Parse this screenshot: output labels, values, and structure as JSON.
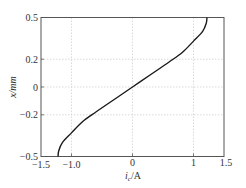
{
  "chart_data": {
    "type": "line",
    "title": "",
    "xlabel": "i_c/A",
    "xlabel_main": "i",
    "xlabel_sub": "c",
    "xlabel_unit": "/A",
    "ylabel": "x/mm",
    "xlim": [
      -1.5,
      1.5
    ],
    "ylim": [
      -0.5,
      0.5
    ],
    "xticks": [
      "-1.5",
      "-1.0",
      "0",
      "1",
      "1.5"
    ],
    "yticks": [
      "0.5",
      "0.2",
      "0",
      "-0.2",
      "-0.5"
    ],
    "grid": true,
    "legend": null,
    "series": [
      {
        "name": "i_c vs x",
        "color": "#1a1a1a",
        "points": [
          [
            -1.22,
            -0.5
          ],
          [
            -1.21,
            -0.46
          ],
          [
            -1.15,
            -0.4
          ],
          [
            -1.0,
            -0.33
          ],
          [
            -0.82,
            -0.25
          ],
          [
            -0.6,
            -0.18
          ],
          [
            -0.3,
            -0.09
          ],
          [
            0,
            0
          ],
          [
            0.3,
            0.09
          ],
          [
            0.6,
            0.18
          ],
          [
            0.82,
            0.25
          ],
          [
            1.0,
            0.33
          ],
          [
            1.15,
            0.4
          ],
          [
            1.21,
            0.46
          ],
          [
            1.22,
            0.5
          ]
        ]
      }
    ]
  },
  "labels": {
    "xtick_m15": "−1.5",
    "xtick_m10": "−1.0",
    "xtick_0": "0",
    "xtick_1": "1",
    "xtick_15": "1.5",
    "ytick_05": "0.5",
    "ytick_02": "0.2",
    "ytick_0": "0",
    "ytick_m02": "−0.2",
    "ytick_m05": "−0.5",
    "xlabel_main": "i",
    "xlabel_sub": "c",
    "xlabel_unit": "/A",
    "ylabel": "x/mm"
  },
  "colors": {
    "axis": "#555555",
    "grid": "#cccccc",
    "curve": "#1a1a1a"
  }
}
